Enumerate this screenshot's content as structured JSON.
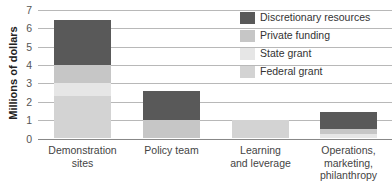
{
  "chart_data": {
    "type": "bar",
    "stacked": true,
    "title": "",
    "xlabel": "",
    "ylabel": "Millions of dollars",
    "ylim": [
      0,
      7
    ],
    "yticks": [
      0,
      1,
      2,
      3,
      4,
      5,
      6,
      7
    ],
    "grid": true,
    "legend_position": "top-right",
    "categories": [
      "Demonstration sites",
      "Policy team",
      "Learning and leverage",
      "Operations, marketing, philanthropy"
    ],
    "series": [
      {
        "name": "Federal grant",
        "color": "#d3d3d3",
        "values": [
          2.3,
          0,
          1.0,
          0
        ]
      },
      {
        "name": "State grant",
        "color": "#e6e6e6",
        "values": [
          0.7,
          0,
          0,
          0.25
        ]
      },
      {
        "name": "Private funding",
        "color": "#c6c6c6",
        "values": [
          1.0,
          1.0,
          0,
          0.25
        ]
      },
      {
        "name": "Discretionary resources",
        "color": "#595959",
        "values": [
          2.45,
          1.6,
          0,
          0.95
        ]
      }
    ],
    "totals": [
      6.45,
      2.6,
      1.0,
      1.45
    ]
  },
  "axis": {
    "ylabel": "Millions of dollars",
    "ticks": [
      "0",
      "1",
      "2",
      "3",
      "4",
      "5",
      "6",
      "7"
    ]
  },
  "xlabels": [
    [
      "Demonstration",
      "sites"
    ],
    [
      "Policy team"
    ],
    [
      "Learning",
      "and leverage"
    ],
    [
      "Operations,",
      "marketing,",
      "philanthropy"
    ]
  ],
  "legend": [
    {
      "label": "Discretionary resources",
      "color": "#595959"
    },
    {
      "label": "Private funding",
      "color": "#c6c6c6"
    },
    {
      "label": "State grant",
      "color": "#e6e6e6"
    },
    {
      "label": "Federal grant",
      "color": "#d3d3d3"
    }
  ]
}
